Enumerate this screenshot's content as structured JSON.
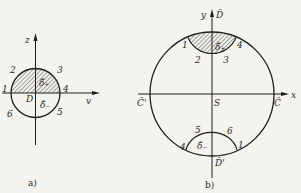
{
  "figures": {
    "a": {
      "caption": "a)",
      "axes": {
        "vertical": "z",
        "horizontal": "v"
      },
      "origin_label": "D",
      "region_upper_label": "δ̃₊",
      "region_lower_label": "δ̃₋",
      "points": [
        "1",
        "2",
        "3",
        "4",
        "5",
        "6"
      ],
      "shaded": "upper half-disk"
    },
    "b": {
      "caption": "b)",
      "axes": {
        "vertical": "y",
        "horizontal": "x"
      },
      "vertical_top_label": "D̃",
      "vertical_bottom_label": "D̃'",
      "horizontal_right_label": "C̃",
      "horizontal_left_label": "C̃'",
      "center_label": "S",
      "top_region_label": "δ̃₊",
      "bottom_region_label": "δ̃₋",
      "top_points": [
        "1",
        "2",
        "3",
        "4"
      ],
      "bottom_points": [
        "4",
        "5",
        "6",
        "1"
      ],
      "shaded": "top lens region"
    }
  }
}
